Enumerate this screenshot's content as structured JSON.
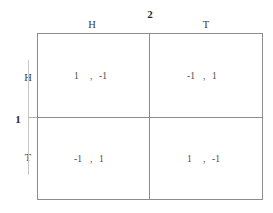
{
  "figure": {
    "type": "normal-form-payoff-matrix",
    "game_name": "Matching Pennies"
  },
  "players": {
    "row_player_label": "1",
    "column_player_label": "2"
  },
  "strategies": {
    "row": [
      "H",
      "T"
    ],
    "column": [
      "H",
      "T"
    ]
  },
  "separator": ",",
  "cells": {
    "HH": {
      "row_payoff": "1",
      "col_payoff": "-1"
    },
    "HT": {
      "row_payoff": "-1",
      "col_payoff": "1"
    },
    "TH": {
      "row_payoff": "-1",
      "col_payoff": "1"
    },
    "TT": {
      "row_payoff": "1",
      "col_payoff": "-1"
    }
  },
  "colors": {
    "line": "#8d8d8d",
    "label_text": "#2b2b2b",
    "header_text": "#3a3a3a",
    "payoff_text": "#4a4a4a",
    "background": "#ffffff"
  },
  "chart_data": {
    "type": "table",
    "title": "",
    "row_header_label": "1",
    "column_header_label": "2",
    "columns": [
      "H",
      "T"
    ],
    "rows": [
      "H",
      "T"
    ],
    "values": [
      [
        "1,  -1",
        "-1,  1"
      ],
      [
        "-1,  1",
        "1,  -1"
      ]
    ],
    "numeric_values": [
      [
        [
          1,
          -1
        ],
        [
          -1,
          1
        ]
      ],
      [
        [
          -1,
          1
        ],
        [
          1,
          -1
        ]
      ]
    ],
    "xlabel": "2",
    "ylabel": "1",
    "grid": true,
    "legend": "none"
  }
}
